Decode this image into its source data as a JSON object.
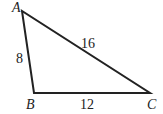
{
  "diagram": {
    "type": "triangle",
    "vertices": {
      "A": {
        "label": "A",
        "x": 22,
        "y": 11
      },
      "B": {
        "label": "B",
        "x": 34,
        "y": 93
      },
      "C": {
        "label": "C",
        "x": 150,
        "y": 93
      }
    },
    "sides": {
      "AB": {
        "label": "8"
      },
      "AC": {
        "label": "16"
      },
      "BC": {
        "label": "12"
      }
    },
    "stroke_color": "#222222"
  }
}
